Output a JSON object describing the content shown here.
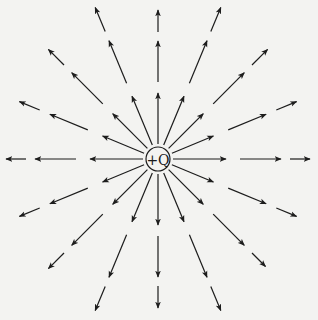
{
  "diagram": {
    "background_color": "#f3f3f1",
    "line_color": "#1c1c1c",
    "center": {
      "x": 158,
      "y": 159
    },
    "charge": {
      "label": "+Q",
      "circle_radius": 12
    },
    "field_lines": {
      "direction_count": 16,
      "angle_step_deg": 22.5,
      "arrowhead": "outward",
      "directions": [
        {
          "angle": 0,
          "segments": [
            [
              15,
              68
            ],
            [
              82,
              123
            ],
            [
              132,
              152
            ]
          ]
        },
        {
          "angle": 22.5,
          "segments": [
            [
              15,
              60
            ],
            [
              76,
              117
            ],
            [
              128,
              150
            ]
          ]
        },
        {
          "angle": 45,
          "segments": [
            [
              15,
              64
            ],
            [
              78,
              122
            ],
            [
              133,
              155
            ]
          ]
        },
        {
          "angle": 67.5,
          "segments": [
            [
              15,
              68
            ],
            [
              82,
              128
            ],
            [
              138,
              164
            ]
          ]
        },
        {
          "angle": 90,
          "segments": [
            [
              15,
              66
            ],
            [
              77,
              118
            ],
            [
              127,
              149
            ]
          ]
        },
        {
          "angle": 112.5,
          "segments": [
            [
              15,
              68
            ],
            [
              82,
              128
            ],
            [
              138,
              164
            ]
          ]
        },
        {
          "angle": 135,
          "segments": [
            [
              15,
              64
            ],
            [
              78,
              122
            ],
            [
              133,
              155
            ]
          ]
        },
        {
          "angle": 157.5,
          "segments": [
            [
              15,
              60
            ],
            [
              76,
              117
            ],
            [
              128,
              150
            ]
          ]
        },
        {
          "angle": 180,
          "segments": [
            [
              15,
              68
            ],
            [
              82,
              123
            ],
            [
              132,
              152
            ]
          ]
        },
        {
          "angle": 202.5,
          "segments": [
            [
              15,
              60
            ],
            [
              76,
              117
            ],
            [
              128,
              150
            ]
          ]
        },
        {
          "angle": 225,
          "segments": [
            [
              15,
              64
            ],
            [
              78,
              122
            ],
            [
              133,
              155
            ]
          ]
        },
        {
          "angle": 247.5,
          "segments": [
            [
              15,
              68
            ],
            [
              82,
              128
            ],
            [
              138,
              164
            ]
          ]
        },
        {
          "angle": 270,
          "segments": [
            [
              15,
              66
            ],
            [
              77,
              118
            ],
            [
              127,
              149
            ]
          ]
        },
        {
          "angle": 292.5,
          "segments": [
            [
              15,
              68
            ],
            [
              82,
              128
            ],
            [
              138,
              164
            ]
          ]
        },
        {
          "angle": 315,
          "segments": [
            [
              15,
              64
            ],
            [
              78,
              122
            ],
            [
              133,
              152
            ]
          ]
        },
        {
          "angle": 337.5,
          "segments": [
            [
              15,
              60
            ],
            [
              76,
              117
            ],
            [
              128,
              150
            ]
          ]
        }
      ]
    }
  }
}
